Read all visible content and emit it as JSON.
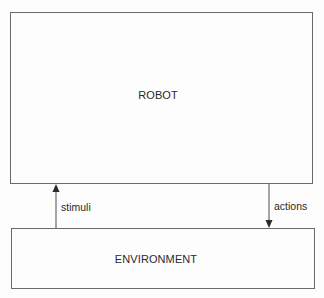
{
  "diagram": {
    "type": "block-diagram",
    "nodes": [
      {
        "id": "robot",
        "label": "ROBOT"
      },
      {
        "id": "environment",
        "label": "ENVIRONMENT"
      }
    ],
    "edges": [
      {
        "from": "environment",
        "to": "robot",
        "label": "stimuli",
        "direction": "up"
      },
      {
        "from": "robot",
        "to": "environment",
        "label": "actions",
        "direction": "down"
      }
    ]
  },
  "colors": {
    "line": "#6a6a6a",
    "text": "#2a2a2a",
    "background": "#fdfdfd"
  }
}
